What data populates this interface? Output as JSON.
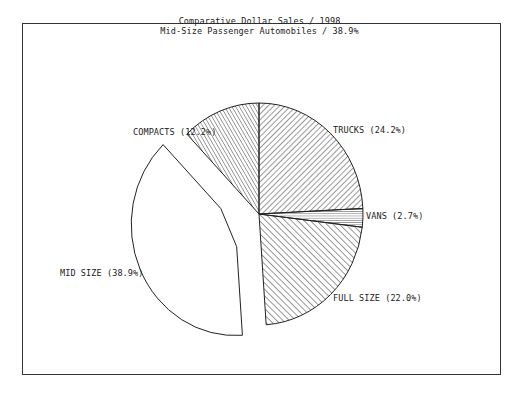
{
  "chart_data": {
    "type": "pie",
    "title": "Comparative Dollar Sales / 1998",
    "subtitle": "Mid-Size Passenger Automobiles / 38.9%",
    "slices": [
      {
        "label": "TRUCKS",
        "value": 24.2,
        "display": "TRUCKS (24.2%)",
        "pattern": "diag-right",
        "exploded": false
      },
      {
        "label": "VANS",
        "value": 2.7,
        "display": "VANS (2.7%)",
        "pattern": "horizontal",
        "exploded": false
      },
      {
        "label": "FULL SIZE",
        "value": 22.0,
        "display": "FULL SIZE (22.0%)",
        "pattern": "diag-left",
        "exploded": false
      },
      {
        "label": "MID SIZE",
        "value": 38.9,
        "display": "MID SIZE (38.9%)",
        "pattern": "none",
        "exploded": true
      },
      {
        "label": "COMPACTS",
        "value": 12.2,
        "display": "COMPACTS (12.2%)",
        "pattern": "diag-left-dense",
        "exploded": false
      }
    ],
    "start_angle_deg": 0,
    "direction": "clockwise",
    "legend": "none",
    "colors": {
      "stroke": "#222222",
      "background": "#ffffff"
    }
  }
}
